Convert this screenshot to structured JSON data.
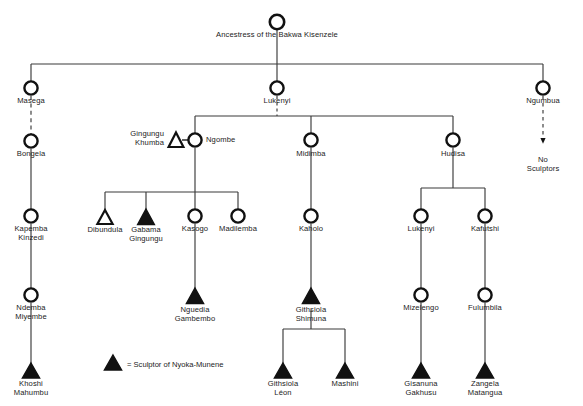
{
  "figure": {
    "type": "genealogy-chart",
    "top_fragment": "",
    "legend": {
      "symbol": "filled-triangle",
      "text": "= Sculptor of Nyoka-Munene"
    },
    "marriage_symbol": "=",
    "symbols": {
      "female": "open-circle",
      "male": "triangle",
      "sculptor": "filled-triangle",
      "non_sculptor_male": "open-triangle"
    },
    "nodes": [
      {
        "id": "ancestress",
        "label": "Ancestress of the Bakwa Kisenzele",
        "shape": "circle",
        "fill": "open",
        "x": 277,
        "y": 22,
        "label_x": 277,
        "label_y": 31,
        "label_align": "center"
      },
      {
        "id": "masega",
        "label": "Masega",
        "shape": "circle",
        "fill": "open",
        "x": 31,
        "y": 88,
        "label_x": 31,
        "label_y": 97,
        "label_align": "center"
      },
      {
        "id": "lukenyi_top",
        "label": "Lukenyi",
        "shape": "circle",
        "fill": "open",
        "x": 277,
        "y": 88,
        "label_x": 277,
        "label_y": 97,
        "label_align": "center"
      },
      {
        "id": "ngumbua",
        "label": "Ngumbua",
        "shape": "circle",
        "fill": "open",
        "x": 543,
        "y": 88,
        "label_x": 543,
        "label_y": 97,
        "label_align": "center"
      },
      {
        "id": "bongela",
        "label": "Bongela",
        "shape": "circle",
        "fill": "open",
        "x": 31,
        "y": 141,
        "label_x": 31,
        "label_y": 150,
        "label_align": "center"
      },
      {
        "id": "no_sculptors",
        "label": "No Sculptors",
        "shape": "none",
        "fill": "none",
        "x": 543,
        "y": 160,
        "label_x": 543,
        "label_y": 156,
        "label_align": "center"
      },
      {
        "id": "gingungu_khumba",
        "label": "Gingungu\nKhumba",
        "shape": "triangle",
        "fill": "open",
        "x": 176,
        "y": 140,
        "label_x": 164,
        "label_y": 135,
        "label_align": "right"
      },
      {
        "id": "ngombe",
        "label": "Ngombe",
        "shape": "circle",
        "fill": "open",
        "x": 195,
        "y": 140,
        "label_x": 206,
        "label_y": 136,
        "label_align": "left"
      },
      {
        "id": "midimba",
        "label": "Midimba",
        "shape": "circle",
        "fill": "open",
        "x": 311,
        "y": 140,
        "label_x": 311,
        "label_y": 150,
        "label_align": "center"
      },
      {
        "id": "hudisa",
        "label": "Hudisa",
        "shape": "circle",
        "fill": "open",
        "x": 453,
        "y": 140,
        "label_x": 453,
        "label_y": 150,
        "label_align": "center"
      },
      {
        "id": "kapemba_kinzedi",
        "label": "Kapemba\nKinzedi",
        "shape": "circle",
        "fill": "open",
        "x": 31,
        "y": 216,
        "label_x": 31,
        "label_y": 225,
        "label_align": "center"
      },
      {
        "id": "dibundula",
        "label": "Dibundula",
        "shape": "triangle",
        "fill": "open",
        "x": 105,
        "y": 218,
        "label_x": 105,
        "label_y": 225,
        "label_align": "center"
      },
      {
        "id": "gabama_gingungu",
        "label": "Gabama\nGingungu",
        "shape": "triangle",
        "fill": "solid",
        "x": 146,
        "y": 218,
        "label_x": 146,
        "label_y": 225,
        "label_align": "center"
      },
      {
        "id": "kasogo",
        "label": "Kasogo",
        "shape": "circle",
        "fill": "open",
        "x": 195,
        "y": 216,
        "label_x": 195,
        "label_y": 225,
        "label_align": "center"
      },
      {
        "id": "madilemba",
        "label": "Madilemba",
        "shape": "circle",
        "fill": "open",
        "x": 238,
        "y": 216,
        "label_x": 238,
        "label_y": 225,
        "label_align": "center"
      },
      {
        "id": "kaholo",
        "label": "Kaholo",
        "shape": "circle",
        "fill": "open",
        "x": 311,
        "y": 216,
        "label_x": 311,
        "label_y": 225,
        "label_align": "center"
      },
      {
        "id": "lukenyi_b",
        "label": "Lukenyi",
        "shape": "circle",
        "fill": "open",
        "x": 421,
        "y": 216,
        "label_x": 421,
        "label_y": 225,
        "label_align": "center"
      },
      {
        "id": "kafutshi",
        "label": "Kafutshi",
        "shape": "circle",
        "fill": "open",
        "x": 485,
        "y": 216,
        "label_x": 485,
        "label_y": 225,
        "label_align": "center"
      },
      {
        "id": "ndemba_miyembe",
        "label": "Ndemba\nMiyembe",
        "shape": "circle",
        "fill": "open",
        "x": 31,
        "y": 295,
        "label_x": 31,
        "label_y": 304,
        "label_align": "center"
      },
      {
        "id": "nguedia_gambembo",
        "label": "Nguedia\nGambembo",
        "shape": "triangle",
        "fill": "solid",
        "x": 195,
        "y": 297,
        "label_x": 195,
        "label_y": 304,
        "label_align": "center"
      },
      {
        "id": "githsiola_shimuna",
        "label": "Githsiola\nShimuna",
        "shape": "triangle",
        "fill": "solid",
        "x": 311,
        "y": 297,
        "label_x": 311,
        "label_y": 304,
        "label_align": "center"
      },
      {
        "id": "mizelengo",
        "label": "Mizelengo",
        "shape": "circle",
        "fill": "open",
        "x": 421,
        "y": 295,
        "label_x": 421,
        "label_y": 304,
        "label_align": "center"
      },
      {
        "id": "fulumbila",
        "label": "Fulumbila",
        "shape": "circle",
        "fill": "open",
        "x": 485,
        "y": 295,
        "label_x": 485,
        "label_y": 304,
        "label_align": "center"
      },
      {
        "id": "khoshi_mahumbu",
        "label": "Khoshi\nMahumbu",
        "shape": "triangle",
        "fill": "solid",
        "x": 31,
        "y": 372,
        "label_x": 31,
        "label_y": 379,
        "label_align": "center"
      },
      {
        "id": "githsiola_leon",
        "label": "Githsiola\nLéon",
        "shape": "triangle",
        "fill": "solid",
        "x": 283,
        "y": 372,
        "label_x": 283,
        "label_y": 379,
        "label_align": "center"
      },
      {
        "id": "mashini",
        "label": "Mashini",
        "shape": "triangle",
        "fill": "solid",
        "x": 345,
        "y": 372,
        "label_x": 345,
        "label_y": 379,
        "label_align": "center"
      },
      {
        "id": "gisanuna_gakhusu",
        "label": "Gisanuna\nGakhusu",
        "shape": "triangle",
        "fill": "solid",
        "x": 421,
        "y": 372,
        "label_x": 421,
        "label_y": 379,
        "label_align": "center"
      },
      {
        "id": "zangela_matangua",
        "label": "Zangela\nMatangua",
        "shape": "triangle",
        "fill": "solid",
        "x": 485,
        "y": 372,
        "label_x": 485,
        "label_y": 379,
        "label_align": "center"
      }
    ],
    "edges": [
      {
        "from": "ancestress",
        "to": "sibling-bus-1",
        "style": "solid"
      },
      {
        "from": "sibling-bus-1",
        "to": "masega",
        "style": "solid"
      },
      {
        "from": "sibling-bus-1",
        "to": "lukenyi_top",
        "style": "solid"
      },
      {
        "from": "sibling-bus-1",
        "to": "ngumbua",
        "style": "solid"
      },
      {
        "from": "masega",
        "to": "bongela",
        "style": "dashed"
      },
      {
        "from": "ngumbua",
        "to": "no_sculptors",
        "style": "dashed-arrow"
      },
      {
        "from": "bongela",
        "to": "kapemba_kinzedi",
        "style": "solid"
      },
      {
        "from": "kapemba_kinzedi",
        "to": "ndemba_miyembe",
        "style": "solid"
      },
      {
        "from": "ndemba_miyembe",
        "to": "khoshi_mahumbu",
        "style": "solid"
      },
      {
        "from": "lukenyi_top",
        "to": "ngombe",
        "style": "solid"
      },
      {
        "from": "lukenyi_top",
        "to": "midimba",
        "style": "solid"
      },
      {
        "from": "lukenyi_top",
        "to": "hudisa",
        "style": "solid"
      },
      {
        "from": "ngombe",
        "to": "dibundula",
        "style": "solid"
      },
      {
        "from": "ngombe",
        "to": "gabama_gingungu",
        "style": "solid"
      },
      {
        "from": "ngombe",
        "to": "kasogo",
        "style": "solid"
      },
      {
        "from": "ngombe",
        "to": "madilemba",
        "style": "solid"
      },
      {
        "from": "kasogo",
        "to": "nguedia_gambembo",
        "style": "solid"
      },
      {
        "from": "midimba",
        "to": "kaholo",
        "style": "solid"
      },
      {
        "from": "kaholo",
        "to": "githsiola_shimuna",
        "style": "solid"
      },
      {
        "from": "githsiola_shimuna",
        "to": "githsiola_leon",
        "style": "solid"
      },
      {
        "from": "githsiola_shimuna",
        "to": "mashini",
        "style": "solid"
      },
      {
        "from": "hudisa",
        "to": "lukenyi_b",
        "style": "solid"
      },
      {
        "from": "hudisa",
        "to": "kafutshi",
        "style": "solid"
      },
      {
        "from": "lukenyi_b",
        "to": "mizelengo",
        "style": "solid"
      },
      {
        "from": "kafutshi",
        "to": "fulumbila",
        "style": "solid"
      },
      {
        "from": "mizelengo",
        "to": "gisanuna_gakhusu",
        "style": "solid"
      },
      {
        "from": "fulumbila",
        "to": "zangela_matangua",
        "style": "solid"
      }
    ]
  }
}
